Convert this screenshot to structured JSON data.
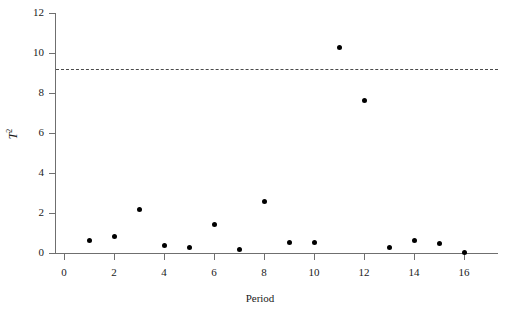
{
  "chart_data": {
    "type": "scatter",
    "title": "",
    "xlabel": "Period",
    "ylabel": "T2",
    "ylabel_base": "T",
    "ylabel_exponent": "2",
    "x": [
      1,
      2,
      3,
      4,
      5,
      6,
      7,
      8,
      9,
      10,
      11,
      12,
      13,
      14,
      15,
      16
    ],
    "values": [
      0.65,
      0.85,
      2.2,
      0.4,
      0.3,
      1.45,
      0.2,
      2.6,
      0.55,
      0.55,
      10.3,
      7.65,
      0.3,
      0.65,
      0.5,
      0.05
    ],
    "series": [
      {
        "name": "T2 statistic",
        "values": [
          0.65,
          0.85,
          2.2,
          0.4,
          0.3,
          1.45,
          0.2,
          2.6,
          0.55,
          0.55,
          10.3,
          7.65,
          0.3,
          0.65,
          0.5,
          0.05
        ]
      }
    ],
    "xlim": [
      -0.35,
      17.35
    ],
    "ylim": [
      0,
      12
    ],
    "xticks": [
      0,
      2,
      4,
      6,
      8,
      10,
      12,
      14,
      16
    ],
    "xtick_labels": [
      "0",
      "2",
      "4",
      "6",
      "8",
      "10",
      "12",
      "14",
      "16"
    ],
    "yticks": [
      0,
      2,
      4,
      6,
      8,
      10,
      12
    ],
    "ytick_labels": [
      "0",
      "2",
      "4",
      "6",
      "8",
      "10",
      "12"
    ],
    "grid": false,
    "legend": "none",
    "annotations": [
      {
        "name": "control-limit",
        "type": "horizontal-dashed-line",
        "value": 9.2,
        "label": ""
      }
    ],
    "marker_color": "#000000",
    "axis_color": "#6f6f6f",
    "threshold_color": "#4a4a4a"
  }
}
